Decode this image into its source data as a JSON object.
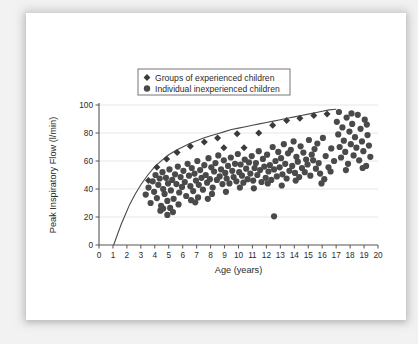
{
  "chart_data": {
    "type": "scatter",
    "title": "",
    "xlabel": "Age (years)",
    "ylabel": "Peak Inspiratory Flow (l/min)",
    "xlim": [
      0,
      20
    ],
    "ylim": [
      0,
      100
    ],
    "xticks": [
      0,
      1,
      2,
      3,
      4,
      5,
      6,
      7,
      8,
      9,
      10,
      11,
      12,
      13,
      14,
      15,
      16,
      17,
      18,
      19,
      20
    ],
    "yticks": [
      0,
      20,
      40,
      60,
      80,
      100
    ],
    "grid": "horizontal",
    "legend_position": "top-left",
    "legend": [
      {
        "label": "Groups of experienced children",
        "marker": "diamond",
        "color": "#3b3b3b"
      },
      {
        "label": "Individual inexperienced children",
        "marker": "circle",
        "color": "#4a4a4a"
      }
    ],
    "series": [
      {
        "name": "Groups of experienced children",
        "marker": "diamond",
        "color": "#3b3b3b",
        "points": [
          [
            3.55,
            46.0
          ],
          [
            4.15,
            55.5
          ],
          [
            4.85,
            61.5
          ],
          [
            5.6,
            66.0
          ],
          [
            6.55,
            70.5
          ],
          [
            7.55,
            73.5
          ],
          [
            8.5,
            76.5
          ],
          [
            8.95,
            69.5
          ],
          [
            9.9,
            79.5
          ],
          [
            10.4,
            69.5
          ],
          [
            11.45,
            80.0
          ],
          [
            12.45,
            85.5
          ],
          [
            13.45,
            89.0
          ],
          [
            14.4,
            90.5
          ],
          [
            15.4,
            92.5
          ],
          [
            16.35,
            93.5
          ]
        ]
      },
      {
        "name": "Individual inexperienced children",
        "marker": "circle",
        "color": "#4a4a4a",
        "points": [
          [
            3.35,
            36.0
          ],
          [
            3.55,
            41.0
          ],
          [
            3.7,
            30.0
          ],
          [
            3.85,
            45.5
          ],
          [
            3.95,
            38.0
          ],
          [
            4.05,
            50.0
          ],
          [
            4.15,
            33.5
          ],
          [
            4.25,
            43.0
          ],
          [
            4.35,
            47.5
          ],
          [
            4.45,
            28.0
          ],
          [
            4.55,
            52.0
          ],
          [
            4.6,
            40.0
          ],
          [
            4.7,
            36.5
          ],
          [
            4.8,
            48.0
          ],
          [
            4.9,
            31.5
          ],
          [
            4.95,
            44.0
          ],
          [
            5.05,
            54.0
          ],
          [
            5.15,
            39.0
          ],
          [
            5.25,
            46.5
          ],
          [
            5.35,
            33.0
          ],
          [
            5.45,
            50.5
          ],
          [
            5.55,
            43.5
          ],
          [
            5.65,
            56.0
          ],
          [
            5.75,
            37.5
          ],
          [
            5.85,
            48.5
          ],
          [
            5.95,
            41.5
          ],
          [
            6.05,
            53.0
          ],
          [
            6.15,
            45.0
          ],
          [
            6.25,
            35.0
          ],
          [
            6.35,
            58.0
          ],
          [
            6.45,
            49.5
          ],
          [
            6.55,
            42.0
          ],
          [
            6.65,
            55.0
          ],
          [
            6.75,
            38.5
          ],
          [
            6.85,
            51.0
          ],
          [
            6.95,
            46.0
          ],
          [
            7.05,
            60.0
          ],
          [
            7.15,
            43.0
          ],
          [
            7.25,
            53.5
          ],
          [
            7.35,
            48.0
          ],
          [
            7.45,
            39.5
          ],
          [
            7.55,
            57.0
          ],
          [
            7.65,
            50.0
          ],
          [
            7.75,
            44.5
          ],
          [
            7.85,
            62.0
          ],
          [
            7.95,
            47.0
          ],
          [
            8.05,
            55.5
          ],
          [
            8.15,
            41.0
          ],
          [
            8.25,
            52.5
          ],
          [
            8.35,
            58.5
          ],
          [
            8.45,
            46.5
          ],
          [
            8.55,
            64.0
          ],
          [
            8.65,
            49.0
          ],
          [
            8.75,
            54.0
          ],
          [
            8.85,
            43.5
          ],
          [
            8.95,
            60.5
          ],
          [
            9.05,
            51.5
          ],
          [
            9.15,
            47.5
          ],
          [
            9.25,
            56.5
          ],
          [
            9.35,
            44.0
          ],
          [
            9.45,
            62.5
          ],
          [
            9.55,
            53.0
          ],
          [
            9.65,
            48.5
          ],
          [
            9.75,
            58.0
          ],
          [
            9.85,
            45.5
          ],
          [
            9.95,
            65.0
          ],
          [
            10.05,
            52.0
          ],
          [
            10.15,
            57.5
          ],
          [
            10.25,
            49.5
          ],
          [
            10.35,
            44.5
          ],
          [
            10.45,
            61.0
          ],
          [
            10.55,
            54.5
          ],
          [
            10.65,
            47.0
          ],
          [
            10.75,
            59.0
          ],
          [
            10.85,
            51.0
          ],
          [
            10.95,
            63.5
          ],
          [
            11.05,
            46.0
          ],
          [
            11.15,
            55.0
          ],
          [
            11.25,
            58.5
          ],
          [
            11.35,
            50.0
          ],
          [
            11.45,
            67.0
          ],
          [
            11.55,
            53.5
          ],
          [
            11.65,
            45.0
          ],
          [
            11.75,
            61.5
          ],
          [
            11.85,
            56.0
          ],
          [
            11.95,
            48.0
          ],
          [
            12.05,
            64.5
          ],
          [
            12.15,
            52.5
          ],
          [
            12.25,
            57.0
          ],
          [
            12.35,
            46.5
          ],
          [
            12.45,
            70.0
          ],
          [
            12.55,
            54.0
          ],
          [
            12.65,
            60.0
          ],
          [
            12.75,
            49.0
          ],
          [
            12.85,
            66.5
          ],
          [
            12.55,
            20.5
          ],
          [
            12.95,
            55.5
          ],
          [
            13.05,
            62.0
          ],
          [
            13.15,
            50.5
          ],
          [
            13.25,
            72.0
          ],
          [
            13.35,
            58.0
          ],
          [
            13.45,
            47.5
          ],
          [
            13.55,
            65.5
          ],
          [
            13.65,
            53.0
          ],
          [
            13.75,
            68.0
          ],
          [
            13.85,
            56.5
          ],
          [
            13.95,
            74.0
          ],
          [
            14.05,
            51.5
          ],
          [
            14.15,
            63.0
          ],
          [
            14.25,
            59.5
          ],
          [
            14.35,
            48.5
          ],
          [
            14.45,
            70.5
          ],
          [
            14.55,
            55.0
          ],
          [
            14.65,
            66.0
          ],
          [
            14.75,
            52.0
          ],
          [
            14.85,
            61.0
          ],
          [
            14.95,
            57.5
          ],
          [
            15.05,
            75.0
          ],
          [
            15.15,
            49.5
          ],
          [
            15.25,
            64.5
          ],
          [
            15.35,
            60.5
          ],
          [
            15.45,
            68.5
          ],
          [
            15.55,
            54.5
          ],
          [
            15.65,
            72.5
          ],
          [
            15.75,
            58.5
          ],
          [
            15.85,
            51.0
          ],
          [
            16.05,
            76.5
          ],
          [
            16.25,
            63.5
          ],
          [
            16.45,
            55.5
          ],
          [
            16.65,
            69.0
          ],
          [
            16.85,
            60.0
          ],
          [
            17.05,
            88.0
          ],
          [
            17.15,
            79.0
          ],
          [
            17.25,
            70.0
          ],
          [
            17.35,
            62.5
          ],
          [
            17.45,
            84.0
          ],
          [
            17.55,
            74.5
          ],
          [
            17.65,
            66.5
          ],
          [
            17.75,
            91.0
          ],
          [
            17.85,
            58.0
          ],
          [
            17.95,
            81.0
          ],
          [
            18.05,
            72.0
          ],
          [
            18.15,
            86.5
          ],
          [
            18.25,
            64.0
          ],
          [
            18.35,
            77.0
          ],
          [
            18.45,
            69.5
          ],
          [
            18.55,
            93.0
          ],
          [
            18.65,
            60.5
          ],
          [
            18.75,
            83.0
          ],
          [
            18.85,
            74.0
          ],
          [
            18.95,
            67.0
          ],
          [
            19.05,
            89.5
          ],
          [
            19.15,
            56.5
          ],
          [
            19.25,
            78.5
          ],
          [
            19.35,
            71.0
          ],
          [
            19.45,
            63.0
          ],
          [
            17.2,
            95.0
          ],
          [
            18.1,
            94.0
          ],
          [
            17.7,
            53.5
          ],
          [
            18.9,
            55.0
          ],
          [
            19.2,
            86.0
          ],
          [
            16.15,
            47.0
          ],
          [
            15.95,
            44.0
          ],
          [
            13.1,
            42.5
          ],
          [
            11.1,
            40.5
          ],
          [
            9.1,
            38.0
          ],
          [
            7.1,
            34.0
          ],
          [
            5.1,
            26.5
          ],
          [
            4.4,
            24.5
          ],
          [
            5.7,
            29.0
          ],
          [
            6.6,
            32.0
          ],
          [
            8.1,
            36.5
          ],
          [
            10.1,
            41.0
          ],
          [
            12.1,
            44.0
          ],
          [
            14.1,
            46.0
          ],
          [
            16.6,
            52.5
          ],
          [
            4.9,
            21.5
          ],
          [
            5.3,
            23.5
          ],
          [
            4.6,
            26.0
          ],
          [
            6.9,
            30.5
          ],
          [
            7.8,
            33.0
          ]
        ]
      }
    ],
    "reference_curve": {
      "name": "upper reference curve",
      "color": "#4a4a4a",
      "points": [
        [
          1.05,
          0.0
        ],
        [
          1.3,
          7.0
        ],
        [
          1.6,
          15.0
        ],
        [
          1.9,
          22.0
        ],
        [
          2.2,
          29.0
        ],
        [
          2.6,
          36.5
        ],
        [
          3.0,
          43.0
        ],
        [
          3.5,
          50.0
        ],
        [
          4.0,
          56.0
        ],
        [
          4.5,
          60.5
        ],
        [
          5.0,
          64.5
        ],
        [
          5.5,
          67.5
        ],
        [
          6.0,
          70.0
        ],
        [
          6.5,
          72.5
        ],
        [
          7.0,
          74.5
        ],
        [
          7.5,
          76.5
        ],
        [
          8.0,
          78.0
        ],
        [
          8.5,
          79.5
        ],
        [
          9.0,
          81.0
        ],
        [
          9.5,
          82.5
        ],
        [
          10.0,
          83.5
        ],
        [
          10.5,
          84.5
        ],
        [
          11.0,
          85.5
        ],
        [
          11.5,
          86.5
        ],
        [
          12.0,
          87.5
        ],
        [
          12.5,
          88.5
        ],
        [
          13.0,
          89.5
        ],
        [
          13.5,
          90.5
        ],
        [
          14.0,
          91.5
        ],
        [
          14.5,
          92.5
        ],
        [
          15.0,
          93.5
        ],
        [
          15.5,
          94.5
        ],
        [
          16.0,
          95.5
        ],
        [
          16.5,
          96.5
        ],
        [
          17.0,
          97.0
        ]
      ]
    }
  }
}
